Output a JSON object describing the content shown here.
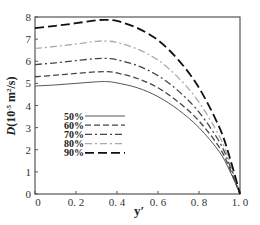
{
  "chart_data": {
    "type": "line",
    "title": "",
    "xlabel": "y′",
    "ylabel": "D(10⁻⁵ m²/s)",
    "xlim": [
      0,
      1.0
    ],
    "ylim": [
      0,
      8
    ],
    "xticks": [
      "0",
      "0.2",
      "0.4",
      "0.6",
      "0.8",
      "1.0"
    ],
    "yticks": [
      "0",
      "1",
      "2",
      "3",
      "4",
      "5",
      "6",
      "7",
      "8"
    ],
    "grid": false,
    "legend_position": "lower-left inside",
    "x": [
      0,
      0.1,
      0.2,
      0.3,
      0.35,
      0.4,
      0.5,
      0.6,
      0.7,
      0.8,
      0.9,
      0.95,
      1.0
    ],
    "series": [
      {
        "name": "50%",
        "style": "solid",
        "color": "#555555",
        "values": [
          4.88,
          4.93,
          5.0,
          5.07,
          5.08,
          5.02,
          4.8,
          4.4,
          3.8,
          3.0,
          1.9,
          1.05,
          0
        ]
      },
      {
        "name": "60%",
        "style": "dashed",
        "color": "#444444",
        "values": [
          5.3,
          5.37,
          5.45,
          5.52,
          5.53,
          5.47,
          5.22,
          4.8,
          4.15,
          3.3,
          2.1,
          1.15,
          0
        ]
      },
      {
        "name": "70%",
        "style": "dash-dot",
        "color": "#444444",
        "values": [
          5.85,
          5.93,
          6.03,
          6.12,
          6.13,
          6.07,
          5.8,
          5.35,
          4.65,
          3.7,
          2.35,
          1.3,
          0
        ]
      },
      {
        "name": "80%",
        "style": "dash-dot light",
        "color": "#aaaaaa",
        "values": [
          6.58,
          6.67,
          6.78,
          6.9,
          6.91,
          6.85,
          6.55,
          6.05,
          5.25,
          4.15,
          2.6,
          1.45,
          0
        ]
      },
      {
        "name": "90%",
        "style": "long-dash heavy",
        "color": "#111111",
        "values": [
          7.5,
          7.6,
          7.72,
          7.85,
          7.87,
          7.82,
          7.5,
          6.95,
          6.05,
          4.8,
          3.0,
          1.65,
          0
        ]
      }
    ]
  },
  "labels": {
    "ylabel_main": "D",
    "ylabel_unit": "(10",
    "ylabel_exp": "-5",
    "ylabel_rest": " m",
    "ylabel_sq": "2",
    "ylabel_end": "/s)",
    "xlabel": "y′"
  },
  "legend": [
    {
      "label": "50%"
    },
    {
      "label": "60%"
    },
    {
      "label": "70%"
    },
    {
      "label": "80%"
    },
    {
      "label": "90%"
    }
  ],
  "ticks": {
    "x": [
      "0",
      "0. 2",
      "0. 4",
      "0. 6",
      "0. 8",
      "1. 0"
    ],
    "y": [
      "0",
      "1",
      "2",
      "3",
      "4",
      "5",
      "6",
      "7",
      "8"
    ]
  }
}
